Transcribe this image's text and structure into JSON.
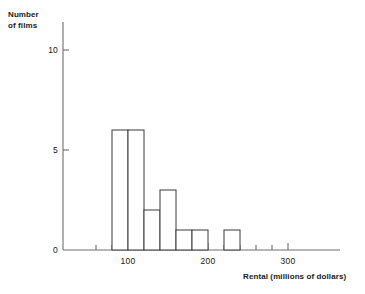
{
  "chart_data": {
    "type": "bar",
    "title": "",
    "subtitle": "",
    "xlabel": "Rental (millions of dollars)",
    "ylabel": "Number\nof films",
    "bin_width": 20,
    "bin_edges": [
      80,
      100,
      120,
      140,
      160,
      180,
      200,
      220,
      240
    ],
    "categories": [
      "80-100",
      "100-120",
      "120-140",
      "140-160",
      "160-180",
      "180-200",
      "200-220",
      "220-240"
    ],
    "values": [
      6,
      6,
      2,
      3,
      1,
      1,
      0,
      1
    ],
    "xlim": [
      60,
      320
    ],
    "ylim": [
      0,
      11
    ],
    "xticks": [
      60,
      80,
      100,
      120,
      140,
      160,
      180,
      200,
      220,
      240,
      260,
      280,
      300
    ],
    "xtick_labels": [
      "",
      "",
      "100",
      "",
      "",
      "",
      "",
      "200",
      "",
      "",
      "",
      "",
      "300"
    ],
    "yticks": [
      0,
      5,
      10
    ],
    "ytick_labels": [
      "0",
      "5",
      "10"
    ],
    "grid": false,
    "legend": false,
    "bar_style": "outline",
    "bar_fill": "#ffffff",
    "bar_stroke": "#3a3a3a",
    "axis_color": "#6e6e6e",
    "text_color": "#1a1a1a"
  },
  "axes": {
    "y_title": "Number\nof films",
    "x_title": "Rental (millions of dollars)"
  },
  "y_tick_labels": [
    {
      "label": "10"
    },
    {
      "label": "5"
    },
    {
      "label": "0"
    }
  ],
  "x_tick_labels": [
    {
      "label": "100"
    },
    {
      "label": "200"
    },
    {
      "label": "300"
    }
  ]
}
